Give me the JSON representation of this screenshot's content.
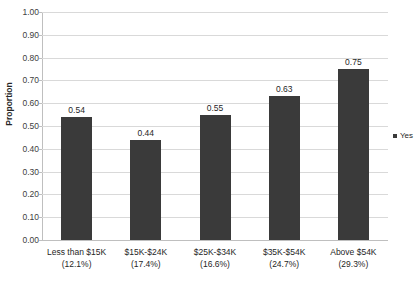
{
  "chart_data": {
    "type": "bar",
    "title": "",
    "subtitle": "",
    "xlabel": "",
    "ylabel": "Proportion",
    "ylim": [
      0.0,
      1.0
    ],
    "ytick_step": 0.1,
    "grid": true,
    "legend_position": "right",
    "categories": [
      "Less than $15K",
      "$15K-$24K",
      "$25K-$34K",
      "$35K-$54K",
      "Above $54K"
    ],
    "category_percents": [
      "(12.1%)",
      "(17.4%)",
      "(16.6%)",
      "(24.7%)",
      "(29.3%)"
    ],
    "values": [
      0.54,
      0.44,
      0.55,
      0.63,
      0.75
    ],
    "value_labels": [
      "0.54",
      "0.44",
      "0.55",
      "0.63",
      "0.75"
    ],
    "ytick_labels": [
      "1.00",
      "0.90",
      "0.80",
      "0.70",
      "0.60",
      "0.50",
      "0.40",
      "0.30",
      "0.20",
      "0.10",
      "0.00"
    ],
    "series": [
      {
        "name": "Yes",
        "color": "#3a3a3a",
        "values": [
          0.54,
          0.44,
          0.55,
          0.63,
          0.75
        ]
      }
    ],
    "legend": [
      {
        "label": "Yes",
        "color": "#3a3a3a"
      }
    ]
  },
  "colors": {
    "bar": "#3a3a3a",
    "gridline": "#d9d9d9",
    "axis": "#bfbfbf",
    "text": "#262626",
    "background": "#ffffff"
  }
}
